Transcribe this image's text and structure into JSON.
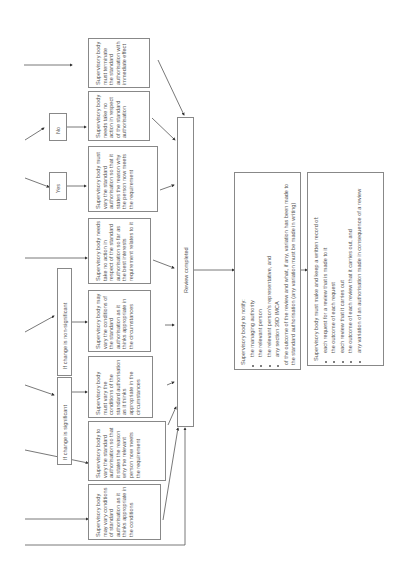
{
  "diagram": {
    "decisions": {
      "no": "No",
      "yes": "Yes",
      "non_significant": "If change is non-significant",
      "significant": "If change is significant"
    },
    "outcomes": [
      "Supervisory body must terminate the standard authorisation with immediate effect",
      "Supervisory body needs take no action in respect of the standard authorisation",
      "Supervisory body must vary the standard authorisation so that it states the reason why the person now meets the requirement",
      "Supervisory body needs take no action in respect of the standard authorisation so far as the best interests requirement relates to it",
      "Supervisory body may vary the conditions of the standard authorisation as it thinks appropriate in the circumstances",
      "Supervisory body must vary the conditions of the standard authorisation as it thinks appropriate in the circumstances",
      "Supervisory body to vary the standard authorisation so that it states the reason why the relevant person now meets the requirement",
      "Supervisory body may vary conditions of standard authorisation as it thinks appropriate in the conditions"
    ],
    "review_completed": "Review completed",
    "notify": {
      "heading": "Supervisory body to notify:",
      "items": [
        "the managing authority",
        "the relevant person",
        "the relevant person's representative, and",
        "any section 39D IMCA"
      ],
      "footer": "of the outcome of the review and what, if any, variation has been made to the standard authorisation (any variation must be made in writing)"
    },
    "record": {
      "heading": "Supervisory body must make and keep a written record of:",
      "items": [
        "each request for a review that is made to it",
        "the outcome of each request",
        "each review that it carries out",
        "the outcome of each review that it carries out, and",
        "any variation of an authorisation made in consequence of a review"
      ]
    }
  }
}
